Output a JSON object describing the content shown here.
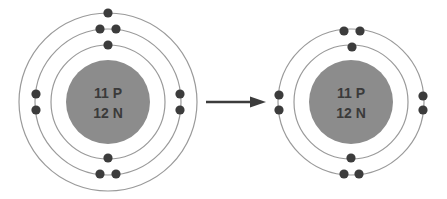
{
  "diagram": {
    "colors": {
      "nucleus": "#8c8c8c",
      "electron": "#3c3c3c",
      "shell": "#9a9a9a",
      "arrow": "#3c3c3c",
      "label": "#3a3a3a"
    },
    "atoms": [
      {
        "id": "sodium-atom",
        "center": [
          108,
          102
        ],
        "nucleus_radius": 42,
        "nucleus_label": {
          "line1": "11 P",
          "line2": "12 N"
        },
        "shells": [
          57,
          73,
          89
        ],
        "electrons": [
          [
            108,
            13
          ],
          [
            100,
            29
          ],
          [
            116,
            29
          ],
          [
            108,
            45
          ],
          [
            36,
            94
          ],
          [
            36,
            110
          ],
          [
            180,
            94
          ],
          [
            180,
            110
          ],
          [
            108,
            158
          ],
          [
            100,
            174
          ],
          [
            116,
            174
          ]
        ],
        "electron_count": 11
      },
      {
        "id": "sodium-ion",
        "center": [
          351,
          102
        ],
        "nucleus_radius": 42,
        "nucleus_label": {
          "line1": "11 P",
          "line2": "12 N"
        },
        "shells": [
          57,
          73
        ],
        "electrons": [
          [
            344,
            31
          ],
          [
            360,
            31
          ],
          [
            352,
            47
          ],
          [
            279,
            95
          ],
          [
            279,
            110
          ],
          [
            423,
            96
          ],
          [
            423,
            110
          ],
          [
            351,
            158
          ],
          [
            344,
            174
          ],
          [
            359,
            174
          ]
        ],
        "electron_count": 10
      }
    ],
    "arrow": {
      "from": [
        206,
        102
      ],
      "to": [
        266,
        102
      ]
    }
  }
}
